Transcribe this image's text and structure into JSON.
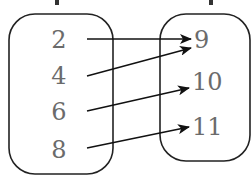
{
  "diagram": {
    "type": "mapping",
    "domain_set": {
      "label_cut_off": true,
      "values": [
        "2",
        "4",
        "6",
        "8"
      ]
    },
    "range_set": {
      "label_cut_off": true,
      "values": [
        "9",
        "10",
        "11"
      ]
    },
    "mappings": [
      {
        "from": "2",
        "to": "9"
      },
      {
        "from": "4",
        "to": "9"
      },
      {
        "from": "6",
        "to": "10"
      },
      {
        "from": "8",
        "to": "11"
      }
    ],
    "colors": {
      "text": "#6b6b6b",
      "lines": "#111111"
    }
  }
}
